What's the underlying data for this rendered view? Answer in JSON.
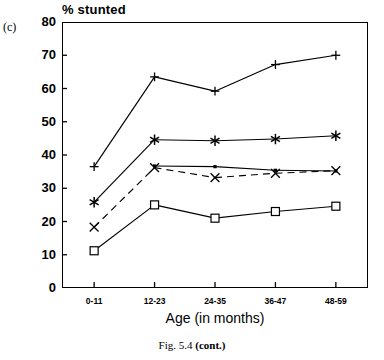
{
  "panel": {
    "label": "(c)"
  },
  "caption": {
    "prefix": "Fig. 5.4 ",
    "bold": "(cont.)"
  },
  "chart_data": {
    "type": "line",
    "title": "",
    "ylabel": "% stunted",
    "xlabel": "Age (in months)",
    "categories": [
      "0-11",
      "12-23",
      "24-35",
      "36-47",
      "48-59"
    ],
    "ylim": [
      0,
      80
    ],
    "yticks": [
      0,
      10,
      20,
      30,
      40,
      50,
      60,
      70,
      80
    ],
    "ytick_labels": [
      "0",
      "10",
      "20",
      "30",
      "40",
      "50",
      "60",
      "70",
      "80"
    ],
    "grid": false,
    "legend": "none",
    "series": [
      {
        "name": "series-plus",
        "marker": "plus",
        "linestyle": "solid",
        "color": "#000000",
        "values": [
          36.5,
          63.5,
          59.2,
          67.2,
          70.0
        ]
      },
      {
        "name": "series-asterisk",
        "marker": "asterisk",
        "linestyle": "solid",
        "color": "#000000",
        "values": [
          25.8,
          44.6,
          44.3,
          44.8,
          45.8
        ]
      },
      {
        "name": "series-dot",
        "marker": "dot",
        "linestyle": "solid",
        "color": "#000000",
        "values": [
          null,
          36.7,
          36.5,
          35.4,
          35.2
        ]
      },
      {
        "name": "series-cross",
        "marker": "cross",
        "linestyle": "dashed",
        "color": "#000000",
        "values": [
          18.3,
          36.2,
          33.2,
          34.5,
          35.3
        ]
      },
      {
        "name": "series-square",
        "marker": "square",
        "linestyle": "solid",
        "color": "#000000",
        "values": [
          11.2,
          25.0,
          21.0,
          23.0,
          24.6
        ]
      }
    ]
  }
}
